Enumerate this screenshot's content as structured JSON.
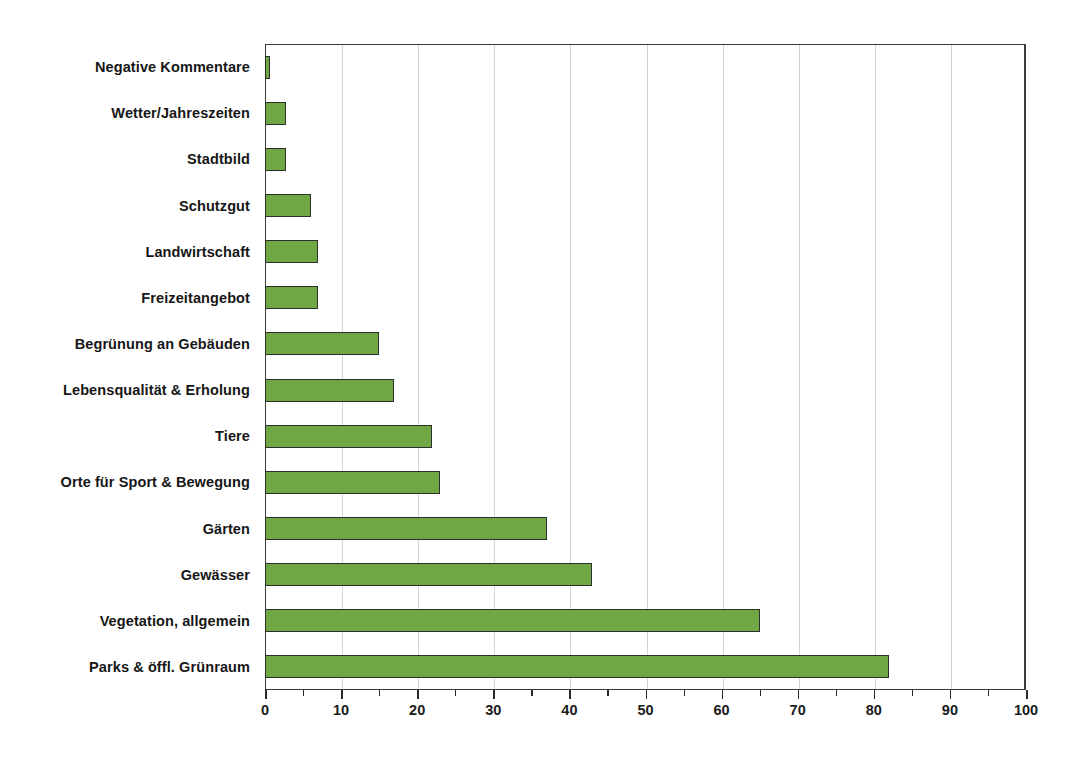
{
  "chart_data": {
    "type": "bar",
    "orientation": "horizontal",
    "title": "",
    "subtitle": "",
    "xlabel": "",
    "ylabel": "",
    "xlim": [
      0,
      100
    ],
    "ylim": null,
    "grid": true,
    "legend": null,
    "legend_position": "none",
    "xticks": [
      "0",
      "10",
      "20",
      "30",
      "40",
      "50",
      "60",
      "70",
      "80",
      "90",
      "100"
    ],
    "xtick_values": [
      0,
      10,
      20,
      30,
      40,
      50,
      60,
      70,
      80,
      90,
      100
    ],
    "categories": [
      "Negative Kommentare",
      "Wetter/Jahreszeiten",
      "Stadtbild",
      "Schutzgut",
      "Landwirtschaft",
      "Freizeitangebot",
      "Begrünung an Gebäuden",
      "Lebensqualität & Erholung",
      "Tiere",
      "Orte für Sport & Bewegung",
      "Gärten",
      "Gewässer",
      "Vegetation, allgemein",
      "Parks & öffl. Grünraum"
    ],
    "values": [
      0.6,
      2.7,
      2.7,
      6,
      7,
      7,
      15,
      17,
      22,
      23,
      37,
      43,
      65,
      82
    ],
    "colors": {
      "bar_fill": "#6FA744",
      "bar_border": "#2f2f2f",
      "gridline": "#d4d4d4",
      "axis": "#3a3a3a",
      "text": "#1a1a1a",
      "background": "#ffffff"
    }
  }
}
